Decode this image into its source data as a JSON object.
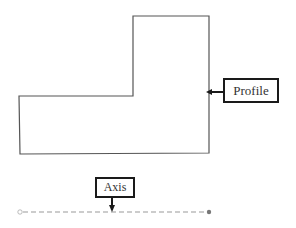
{
  "diagram": {
    "profile_label": "Profile",
    "axis_label": "Axis",
    "colors": {
      "outline": "#555555",
      "callout": "#1a1a1a",
      "axis_line": "#9a9a9a"
    },
    "profile_polygon": [
      [
        19,
        96
      ],
      [
        133,
        96
      ],
      [
        133,
        16
      ],
      [
        209,
        16
      ],
      [
        209,
        153
      ],
      [
        19,
        154
      ]
    ]
  }
}
